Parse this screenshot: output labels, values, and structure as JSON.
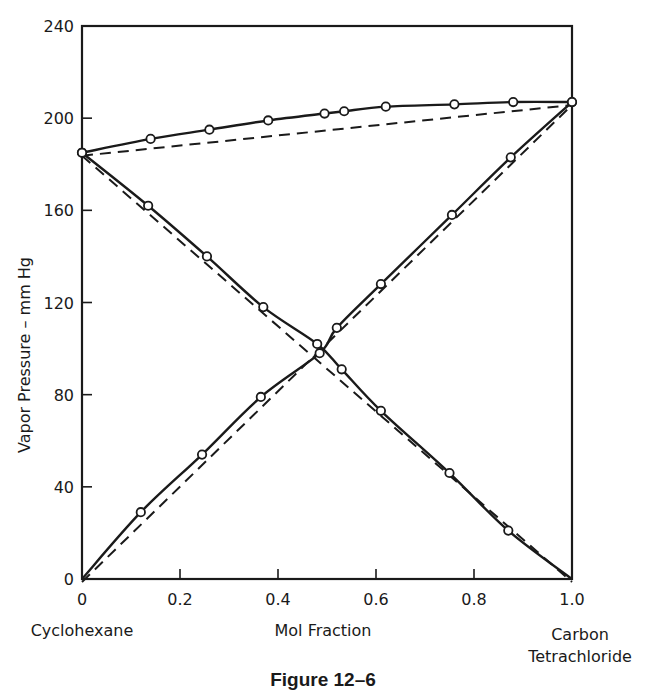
{
  "figure": {
    "caption": "Figure 12–6"
  },
  "axes": {
    "ylabel": "Vapor Pressure – mm Hg",
    "xlabel": "Mol Fraction",
    "x_left_label": "Cyclohexane",
    "x_right_label_line1": "Carbon",
    "x_right_label_line2": "Tetrachloride",
    "y_ticks": [
      "0",
      "40",
      "80",
      "120",
      "160",
      "200",
      "240"
    ],
    "x_ticks": [
      "0",
      "0.2",
      "0.4",
      "0.6",
      "0.8",
      "1.0"
    ]
  },
  "colors": {
    "ink": "#1a1a1a",
    "background": "#ffffff",
    "marker_fill": "#ffffff"
  },
  "chart_data": {
    "type": "line",
    "title": "Figure 12–6",
    "xlabel": "Mol Fraction (Cyclohexane at 0, Carbon Tetrachloride at 1.0)",
    "ylabel": "Vapor Pressure – mm Hg",
    "xlim": [
      0,
      1.0
    ],
    "ylim": [
      0,
      240
    ],
    "x_ticks": [
      0,
      0.2,
      0.4,
      0.6,
      0.8,
      1.0
    ],
    "y_ticks": [
      0,
      40,
      80,
      120,
      160,
      200,
      240
    ],
    "grid": false,
    "legend": null,
    "series": [
      {
        "name": "Total vapor pressure (observed)",
        "style": "solid-with-open-circles",
        "x": [
          0.0,
          0.14,
          0.26,
          0.38,
          0.495,
          0.535,
          0.62,
          0.76,
          0.88,
          1.0
        ],
        "y": [
          185,
          191,
          195,
          199,
          202,
          203,
          205,
          206,
          207,
          207
        ]
      },
      {
        "name": "Cyclohexane partial pressure (observed)",
        "style": "solid-with-open-circles",
        "x": [
          0.0,
          0.135,
          0.255,
          0.37,
          0.48,
          0.53,
          0.61,
          0.75,
          0.87,
          1.0
        ],
        "y": [
          185,
          162,
          140,
          118,
          102,
          91,
          73,
          46,
          21,
          0
        ]
      },
      {
        "name": "Carbon tetrachloride partial pressure (observed)",
        "style": "solid-with-open-circles",
        "x": [
          0.0,
          0.12,
          0.245,
          0.365,
          0.485,
          0.52,
          0.61,
          0.755,
          0.875,
          1.0
        ],
        "y": [
          0,
          29,
          54,
          79,
          98,
          109,
          128,
          158,
          183,
          207
        ]
      },
      {
        "name": "Total pressure (Raoult's law, ideal)",
        "style": "dashed",
        "x": [
          0.0,
          1.0
        ],
        "y": [
          185,
          207
        ]
      },
      {
        "name": "Cyclohexane partial (Raoult's law, ideal)",
        "style": "dashed",
        "x": [
          0.0,
          1.0
        ],
        "y": [
          185,
          0
        ]
      },
      {
        "name": "Carbon tetrachloride partial (Raoult's law, ideal)",
        "style": "dashed",
        "x": [
          0.0,
          1.0
        ],
        "y": [
          0,
          207
        ]
      }
    ]
  }
}
